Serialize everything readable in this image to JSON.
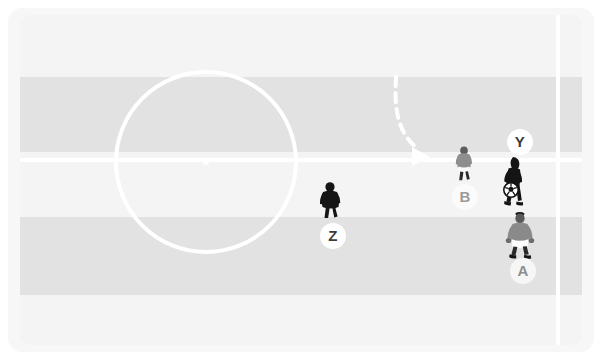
{
  "scene": {
    "title": "Soccer tactical diagram",
    "width": 602,
    "height": 360,
    "background_color": "#ffffff"
  },
  "pitch": {
    "surface_color": "#f2f2f2",
    "surround_color": "#f7f7f7",
    "line_color": "#ffffff",
    "stripes": [
      {
        "name": "stripe-1-light",
        "top": 0,
        "height": 62,
        "color": "#f4f4f4"
      },
      {
        "name": "stripe-2-dark",
        "top": 62,
        "height": 75,
        "color": "#e2e2e2"
      },
      {
        "name": "stripe-3-light",
        "top": 137,
        "height": 65,
        "color": "#f4f4f4"
      },
      {
        "name": "stripe-4-dark",
        "top": 202,
        "height": 78,
        "color": "#e2e2e2"
      },
      {
        "name": "stripe-5-light",
        "top": 280,
        "height": 50,
        "color": "#f4f4f4"
      }
    ],
    "markings": {
      "halfway_line_y": 145,
      "right_touchline_x": 538,
      "center_circle": {
        "cx": 186,
        "cy": 147,
        "r": 92
      },
      "center_spot": {
        "cx": 186,
        "cy": 147,
        "r": 3
      }
    }
  },
  "annotations": {
    "run_path": {
      "label": "dashed-run-arrow",
      "style": "dashed",
      "color": "#ffffff",
      "description": "curved dashed run from upper area bending right to the halfway line",
      "arrow_head": true
    }
  },
  "players": [
    {
      "id": "Y",
      "team": "attacking",
      "kit_color": "#1b1b1b",
      "label": "Y",
      "badge_style": "solid",
      "badge_x": 512,
      "badge_y": 127,
      "figure_x": 505,
      "figure_y": 188,
      "has_ball": true,
      "facing": "left"
    },
    {
      "id": "A",
      "team": "defending",
      "kit_color": "#8c8c8c",
      "label": "A",
      "badge_style": "soft",
      "badge_x": 515,
      "badge_y": 256,
      "figure_x": 512,
      "figure_y": 241,
      "has_ball": false,
      "facing": "away"
    },
    {
      "id": "B",
      "team": "defending",
      "kit_color": "#a3a3a3",
      "label": "B",
      "badge_style": "faint",
      "badge_x": 457,
      "badge_y": 182,
      "figure_x": 456,
      "figure_y": 166,
      "has_ball": false,
      "facing": "away"
    },
    {
      "id": "Z",
      "team": "attacking",
      "kit_color": "#1b1b1b",
      "label": "Z",
      "badge_style": "solid",
      "badge_x": 325,
      "badge_y": 221,
      "figure_x": 322,
      "figure_y": 205,
      "has_ball": false,
      "facing": "away"
    }
  ],
  "ball": {
    "name": "soccer-ball",
    "x": 503,
    "y": 177,
    "radius": 7,
    "color": "#ffffff",
    "panel_color": "#1b1b1b"
  }
}
